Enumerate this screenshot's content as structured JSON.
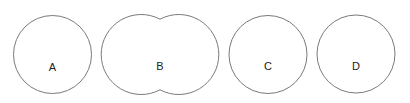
{
  "diagram": {
    "background": "#ffffff",
    "stroke_color": "#7a7a7a",
    "label_color": "#222222",
    "shapes": [
      {
        "id": "A",
        "label": "A",
        "kind": "circle"
      },
      {
        "id": "B",
        "label": "B",
        "kind": "two-overlapping-circles-union"
      },
      {
        "id": "C",
        "label": "C",
        "kind": "circle"
      },
      {
        "id": "D",
        "label": "D",
        "kind": "circle"
      }
    ]
  }
}
